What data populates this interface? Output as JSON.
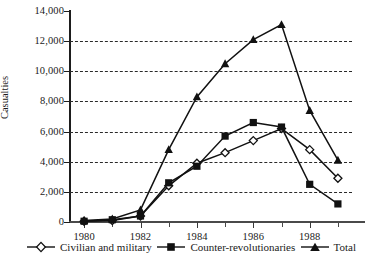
{
  "chart_data": {
    "type": "line",
    "title": "",
    "xlabel": "",
    "ylabel": "Casualties",
    "x": [
      1980,
      1981,
      1982,
      1983,
      1984,
      1985,
      1986,
      1987,
      1988,
      1989
    ],
    "xlim": [
      1979.5,
      1989.5
    ],
    "ylim": [
      0,
      14000
    ],
    "xticks": [
      1980,
      1981,
      1982,
      1983,
      1984,
      1985,
      1986,
      1987,
      1988,
      1989
    ],
    "xtick_labels": [
      "1980",
      "",
      "1982",
      "",
      "1984",
      "",
      "1986",
      "",
      "1988",
      ""
    ],
    "yticks": [
      0,
      2000,
      4000,
      6000,
      8000,
      10000,
      12000,
      14000
    ],
    "ytick_labels": [
      "0",
      "2,000",
      "4,000",
      "6,000",
      "8,000",
      "10,000",
      "12,000",
      "14,000"
    ],
    "grid": "horizontal-dashed",
    "legend_position": "bottom",
    "series": [
      {
        "name": "Civilian and military",
        "marker": "open-diamond",
        "color": "#111111",
        "values": [
          50,
          100,
          400,
          2400,
          3900,
          4600,
          5400,
          6200,
          4800,
          2900
        ]
      },
      {
        "name": "Counter-revolutionaries",
        "marker": "filled-square",
        "color": "#111111",
        "values": [
          50,
          150,
          400,
          2600,
          3700,
          5700,
          6600,
          6300,
          2500,
          1200
        ]
      },
      {
        "name": "Total",
        "marker": "filled-triangle",
        "color": "#111111",
        "values": [
          100,
          200,
          800,
          4800,
          8300,
          10500,
          12100,
          13100,
          7400,
          4100
        ]
      }
    ]
  }
}
